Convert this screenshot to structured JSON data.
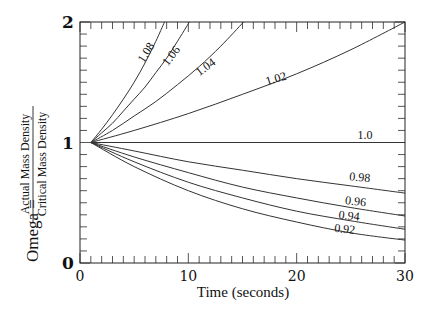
{
  "chart_data": {
    "type": "line",
    "title": "",
    "xlabel": "Time (seconds)",
    "ylabel": "Omega = Actual Mass Density / Critical Mass Density",
    "ylabel_parts": {
      "prefix": "Omega =",
      "numerator": "Actual Mass Density",
      "denominator": "Critical Mass Density"
    },
    "xlim": [
      0,
      30
    ],
    "ylim": [
      0,
      2
    ],
    "xticks": [
      0,
      10,
      20,
      30
    ],
    "xtick_labels": [
      "0",
      "10",
      "20",
      "30"
    ],
    "yticks": [
      0,
      1,
      2
    ],
    "ytick_labels": [
      "0",
      "1",
      "2"
    ],
    "minor_x_step": 1,
    "minor_y_step": 0.1,
    "grid": false,
    "legend": "inline curve labels",
    "series": [
      {
        "name": "1.08",
        "x": [
          1,
          2,
          3,
          4,
          5,
          6,
          7,
          7.8
        ],
        "y": [
          1.0,
          1.11,
          1.23,
          1.36,
          1.5,
          1.66,
          1.84,
          2.0
        ],
        "label_pos": [
          6.4,
          1.73
        ],
        "label_angle": -58
      },
      {
        "name": "1.06",
        "x": [
          1,
          2,
          3,
          4,
          5,
          6,
          7,
          8,
          9,
          10.1
        ],
        "y": [
          1.0,
          1.08,
          1.16,
          1.26,
          1.36,
          1.46,
          1.58,
          1.7,
          1.84,
          2.0
        ],
        "label_pos": [
          8.7,
          1.7
        ],
        "label_angle": -52
      },
      {
        "name": "1.04",
        "x": [
          1,
          3,
          5,
          7,
          9,
          11,
          13,
          15.1
        ],
        "y": [
          1.0,
          1.1,
          1.22,
          1.34,
          1.48,
          1.63,
          1.8,
          2.0
        ],
        "label_pos": [
          11.8,
          1.6
        ],
        "label_angle": -36
      },
      {
        "name": "1.02",
        "x": [
          1,
          5,
          10,
          15,
          20,
          25,
          30
        ],
        "y": [
          1.0,
          1.1,
          1.24,
          1.4,
          1.57,
          1.77,
          2.0
        ],
        "label_pos": [
          18.2,
          1.5
        ],
        "label_angle": -17
      },
      {
        "name": "1.0",
        "x": [
          1,
          30
        ],
        "y": [
          1.0,
          1.0
        ],
        "label_pos": [
          26.3,
          1.03
        ],
        "label_angle": 0
      },
      {
        "name": "0.98",
        "x": [
          1,
          5,
          10,
          15,
          20,
          25,
          30
        ],
        "y": [
          1.0,
          0.93,
          0.84,
          0.77,
          0.7,
          0.64,
          0.58
        ],
        "label_pos": [
          25.8,
          0.68
        ],
        "label_angle": 5
      },
      {
        "name": "0.96",
        "x": [
          1,
          5,
          10,
          15,
          20,
          25,
          30
        ],
        "y": [
          1.0,
          0.88,
          0.75,
          0.63,
          0.54,
          0.46,
          0.39
        ],
        "label_pos": [
          25.4,
          0.48
        ],
        "label_angle": 6
      },
      {
        "name": "0.94",
        "x": [
          1,
          5,
          10,
          15,
          20,
          25,
          30
        ],
        "y": [
          1.0,
          0.84,
          0.67,
          0.54,
          0.43,
          0.35,
          0.28
        ],
        "label_pos": [
          24.8,
          0.36
        ],
        "label_angle": 6
      },
      {
        "name": "0.92",
        "x": [
          1,
          5,
          10,
          15,
          20,
          25,
          30
        ],
        "y": [
          1.0,
          0.8,
          0.6,
          0.45,
          0.34,
          0.25,
          0.19
        ],
        "label_pos": [
          24.4,
          0.25
        ],
        "label_angle": 6
      }
    ]
  }
}
